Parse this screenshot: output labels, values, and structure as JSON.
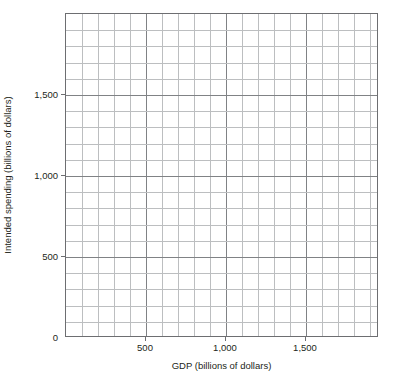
{
  "chart_data": {
    "type": "scatter",
    "title": "",
    "subtitle": "",
    "xlabel": "GDP (billions of dollars)",
    "ylabel": "Intended spending (billions of dollars)",
    "xlim": [
      0,
      1957
    ],
    "ylim": [
      0,
      2000
    ],
    "x_major_ticks": [
      500,
      1000,
      1500
    ],
    "x_major_ticklabels": [
      "500",
      "1,000",
      "1,500"
    ],
    "y_major_ticks": [
      0,
      500,
      1000,
      1500
    ],
    "y_major_ticklabels": [
      "0",
      "500",
      "1,000",
      "1,500"
    ],
    "x_minor_step": 100,
    "y_minor_step": 100,
    "x_major_step": 500,
    "y_major_step": 500,
    "grid": true,
    "grid_style": "graph-paper",
    "legend": null,
    "legend_position": "none",
    "series": [],
    "values": [],
    "annotations": [],
    "note": "Empty coordinate grid with no plotted data; axes are blank graph paper for drawing a 45-degree line and spending function."
  },
  "axes": {
    "origin_label": "0",
    "x_title": "GDP (billions of dollars)",
    "y_title": "Intended spending (billions of dollars)",
    "x_ticks": [
      {
        "value": 500,
        "label": "500"
      },
      {
        "value": 1000,
        "label": "1,000"
      },
      {
        "value": 1500,
        "label": "1,500"
      }
    ],
    "y_ticks": [
      {
        "value": 0,
        "label": "0"
      },
      {
        "value": 500,
        "label": "500"
      },
      {
        "value": 1000,
        "label": "1,000"
      },
      {
        "value": 1500,
        "label": "1,500"
      }
    ]
  },
  "colors": {
    "background": "#ffffff",
    "axis_line": "#6d6e71",
    "grid_minor": "#bcbec0",
    "grid_major": "#808285",
    "text": "#231f20"
  }
}
